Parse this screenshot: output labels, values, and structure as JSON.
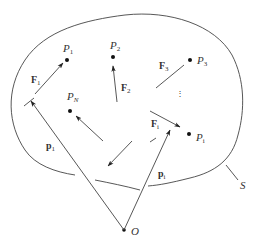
{
  "diagram": {
    "type": "vector system of particles",
    "surface_label": "S",
    "origin_label": "O",
    "points": [
      {
        "id": "P1",
        "label": "P",
        "sub": "1"
      },
      {
        "id": "P2",
        "label": "P",
        "sub": "2"
      },
      {
        "id": "P3",
        "label": "P",
        "sub": "3"
      },
      {
        "id": "PN",
        "label": "P",
        "sub": "N"
      },
      {
        "id": "Pi",
        "label": "P",
        "sub": "i"
      }
    ],
    "forces": [
      {
        "id": "F1",
        "label": "F",
        "sub": "1"
      },
      {
        "id": "F2",
        "label": "F",
        "sub": "2"
      },
      {
        "id": "F3",
        "label": "F",
        "sub": "3"
      },
      {
        "id": "Fi",
        "label": "F",
        "sub": "i"
      }
    ],
    "position_vectors": [
      {
        "id": "p1",
        "label": "p",
        "sub": "1"
      },
      {
        "id": "pi",
        "label": "p",
        "sub": "i"
      }
    ],
    "ellipsis": "⋮"
  },
  "colors": {
    "line": "#444444",
    "text": "#333333",
    "background": "#ffffff"
  }
}
